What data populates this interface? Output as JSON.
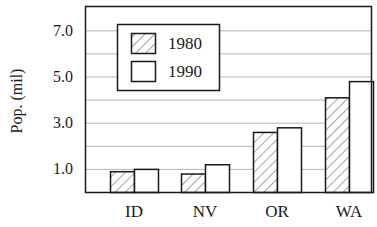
{
  "chart_data": {
    "type": "bar",
    "title": "",
    "xlabel": "",
    "ylabel": "Pop. (mil)",
    "categories": [
      "ID",
      "NV",
      "OR",
      "WA"
    ],
    "series": [
      {
        "name": "1980",
        "pattern": "hatched",
        "values": [
          0.9,
          0.8,
          2.6,
          4.1
        ]
      },
      {
        "name": "1990",
        "pattern": "solid-white",
        "values": [
          1.0,
          1.2,
          2.8,
          4.8
        ]
      }
    ],
    "ylim": [
      0,
      7.8
    ],
    "yticks": [
      1.0,
      3.0,
      5.0,
      7.0
    ],
    "ytick_labels": [
      "1.0",
      "3.0",
      "5.0",
      "7.0"
    ],
    "gridlines": [
      1,
      2,
      3,
      4,
      5,
      6,
      7
    ],
    "grid": true,
    "legend": {
      "position": "upper-left",
      "entries": [
        "1980",
        "1990"
      ]
    },
    "colors": {
      "frame": "#1a1a1a",
      "grid": "#b5b5b5",
      "bar_fill": "#ffffff",
      "hatch": "#4a4a4a"
    }
  }
}
